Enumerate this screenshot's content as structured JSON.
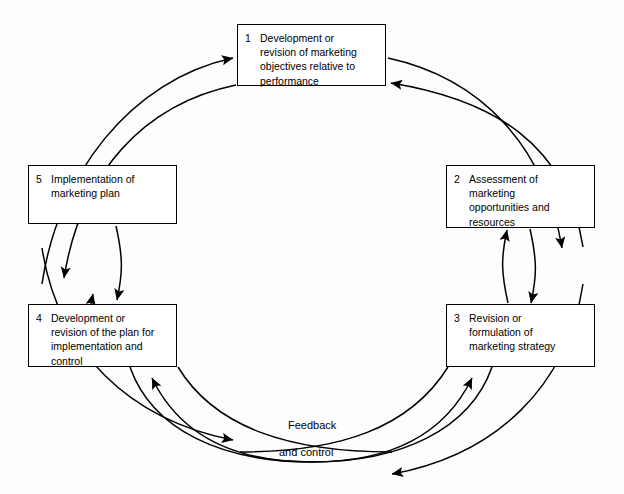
{
  "diagram": {
    "type": "cycle-flowchart",
    "background_color": "#fdfdfd",
    "line_color": "#000000",
    "text_color": "#000000",
    "nodes": [
      {
        "number": "1",
        "label": "Development or\nrevision of marketing\nobjectives relative to\nperformance",
        "position": "top"
      },
      {
        "number": "2",
        "label": "Assessment of\nmarketing\nopportunities and\nresources",
        "position": "right-top"
      },
      {
        "number": "3",
        "label": "Revision or\nformulation of\nmarketing strategy",
        "position": "right-bottom"
      },
      {
        "number": "4",
        "label": "Development or\nrevision of the plan for\nimplementation and\ncontrol",
        "position": "left-bottom"
      },
      {
        "number": "5",
        "label": "Implementation of\nmarketing plan",
        "position": "left-top"
      }
    ],
    "loop_labels": {
      "feedback": "Feedback",
      "and_control": "and control"
    },
    "connections": [
      {
        "from": "5",
        "to": "1",
        "style": "bidirectional-curved"
      },
      {
        "from": "1",
        "to": "2",
        "style": "bidirectional-curved"
      },
      {
        "from": "2",
        "to": "3",
        "style": "bidirectional-curved"
      },
      {
        "from": "3",
        "to": "4",
        "style": "bidirectional-curved",
        "label": "Feedback and control"
      },
      {
        "from": "4",
        "to": "5",
        "style": "bidirectional-curved"
      }
    ]
  }
}
